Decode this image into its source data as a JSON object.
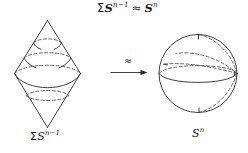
{
  "figure": {
    "title_formula": {
      "sigma": "Σ",
      "base_left": "S",
      "exponent_left": "n−1",
      "relation": "≈",
      "base_right": "S",
      "exponent_right": "n",
      "plain": "ΣS^{n−1} ≈ S^n"
    },
    "arrow": {
      "label": "≈",
      "direction": "right"
    },
    "left_shape": {
      "name": "suspension-double-cone",
      "label": {
        "sigma": "Σ",
        "base": "S",
        "exponent": "n−1",
        "plain": "ΣS^{n−1}"
      }
    },
    "right_shape": {
      "name": "sphere",
      "label": {
        "base": "S",
        "exponent": "n",
        "plain": "S^n"
      }
    },
    "colors": {
      "background": "#ffffff",
      "ink": "#1d1d1d",
      "stroke_solid": "#2b2b2b",
      "stroke_dashed": "#4a4a4a"
    }
  }
}
